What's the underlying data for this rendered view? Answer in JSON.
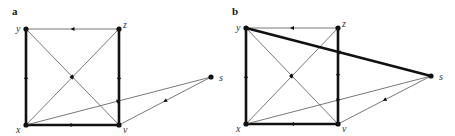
{
  "panels": [
    {
      "label": "a",
      "nodes": {
        "y": {
          "label": "y",
          "x": 26,
          "y": 29
        },
        "z": {
          "label": "z",
          "x": 119,
          "y": 29
        },
        "x": {
          "label": "x",
          "x": 26,
          "y": 125
        },
        "v": {
          "label": "v",
          "x": 119,
          "y": 125
        },
        "s": {
          "label": "s",
          "x": 211,
          "y": 77
        }
      },
      "edges": [
        {
          "from": "z",
          "to": "y",
          "thick": false
        },
        {
          "from": "x",
          "to": "y",
          "thick": true
        },
        {
          "from": "x",
          "to": "v",
          "thick": true
        },
        {
          "from": "v",
          "to": "z",
          "thick": true
        },
        {
          "from": "y",
          "to": "v",
          "thick": false
        },
        {
          "from": "x",
          "to": "z",
          "thick": false
        },
        {
          "from": "x",
          "to": "s",
          "thick": false
        },
        {
          "from": "s",
          "to": "v",
          "thick": false
        }
      ]
    },
    {
      "label": "b",
      "nodes": {
        "y": {
          "label": "y",
          "x": 246,
          "y": 28
        },
        "z": {
          "label": "z",
          "x": 338,
          "y": 28
        },
        "x": {
          "label": "x",
          "x": 246,
          "y": 124
        },
        "v": {
          "label": "v",
          "x": 338,
          "y": 124
        },
        "s": {
          "label": "s",
          "x": 431,
          "y": 76
        }
      },
      "edges": [
        {
          "from": "z",
          "to": "y",
          "thick": false
        },
        {
          "from": "x",
          "to": "y",
          "thick": true
        },
        {
          "from": "v",
          "to": "x",
          "thick": true
        },
        {
          "from": "z",
          "to": "v",
          "thick": true
        },
        {
          "from": "y",
          "to": "v",
          "thick": false
        },
        {
          "from": "x",
          "to": "z",
          "thick": false
        },
        {
          "from": "x",
          "to": "s",
          "thick": false
        },
        {
          "from": "s",
          "to": "v",
          "thick": false
        },
        {
          "from": "s",
          "to": "y",
          "thick": true
        }
      ]
    }
  ],
  "colors": {
    "line": "#555555",
    "thick": "#111111",
    "node": "#111111"
  }
}
